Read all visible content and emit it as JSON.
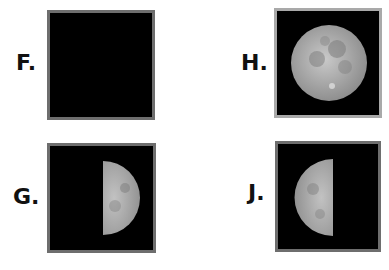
{
  "panels": [
    {
      "id": "F",
      "label": "F.",
      "phase": "waxing-crescent-thin",
      "description": "Thin crescent moon lit on right edge"
    },
    {
      "id": "H",
      "label": "H.",
      "phase": "full-moon",
      "description": "Full moon"
    },
    {
      "id": "G",
      "label": "G.",
      "phase": "first-quarter",
      "description": "Half moon lit on right side"
    },
    {
      "id": "J",
      "label": "J.",
      "phase": "last-quarter",
      "description": "Half moon lit on left side"
    }
  ],
  "colors": {
    "background": "#ffffff",
    "frame_fill": "#000000",
    "frame_border_dark": "#6e6e6e",
    "frame_border_light": "#a9a9a9",
    "moon": "#b8b8b8"
  }
}
